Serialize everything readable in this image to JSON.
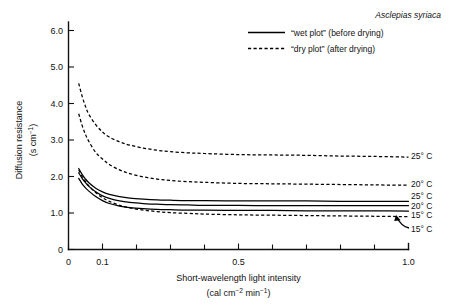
{
  "chart_data": {
    "type": "line",
    "title": "",
    "species_annotation": "Asclepias syriaca",
    "xlabel_line1": "Short-wavelength light intensity",
    "xlabel_line2_prefix": "(cal cm",
    "xlabel_line2_sup1": "−2",
    "xlabel_line2_mid": " min",
    "xlabel_line2_sup2": "−1",
    "xlabel_line2_suffix": ")",
    "ylabel_line1": "Diffusion resistance",
    "ylabel_line2_prefix": "(s cm",
    "ylabel_line2_sup": "−1",
    "ylabel_line2_suffix": ")",
    "xlim": [
      0,
      1.0
    ],
    "ylim": [
      0,
      6.5
    ],
    "grid": false,
    "x_major_ticks": [
      0,
      0.1,
      0.5,
      1.0
    ],
    "x_major_tick_labels": [
      "0",
      "0.1",
      "0.5",
      "1.0"
    ],
    "x_minor_ticks": [
      0.2,
      0.3,
      0.4,
      0.6,
      0.7,
      0.8,
      0.9
    ],
    "y_ticks": [
      0,
      1.0,
      2.0,
      3.0,
      4.0,
      5.0,
      6.0
    ],
    "y_tick_labels": [
      "0",
      "1.0",
      "2.0",
      "3.0",
      "4.0",
      "5.0",
      "6.0"
    ],
    "legend_position": "top-right",
    "legend": [
      {
        "style": "solid",
        "label": "“wet plot” (before drying)"
      },
      {
        "style": "dashed",
        "label": "“dry plot” (after drying)"
      }
    ],
    "series": [
      {
        "name": "dry plot 25° C",
        "plot": "dry plot",
        "style": "dashed",
        "end_label": "25° C",
        "x": [
          0.03,
          0.04,
          0.05,
          0.06,
          0.08,
          0.1,
          0.12,
          0.15,
          0.18,
          0.22,
          0.26,
          0.3,
          0.35,
          0.4,
          0.5,
          0.6,
          0.7,
          0.8,
          0.9,
          1.0
        ],
        "y": [
          4.55,
          4.2,
          3.92,
          3.7,
          3.42,
          3.22,
          3.08,
          2.95,
          2.86,
          2.78,
          2.72,
          2.68,
          2.65,
          2.63,
          2.6,
          2.59,
          2.58,
          2.56,
          2.55,
          2.53
        ]
      },
      {
        "name": "dry plot 20° C",
        "plot": "dry plot",
        "style": "dashed",
        "end_label": "20° C",
        "x": [
          0.03,
          0.04,
          0.05,
          0.06,
          0.08,
          0.1,
          0.12,
          0.15,
          0.18,
          0.22,
          0.26,
          0.3,
          0.35,
          0.4,
          0.5,
          0.6,
          0.7,
          0.8,
          0.9,
          1.0
        ],
        "y": [
          3.72,
          3.4,
          3.15,
          2.96,
          2.66,
          2.48,
          2.33,
          2.18,
          2.08,
          1.99,
          1.93,
          1.89,
          1.86,
          1.84,
          1.81,
          1.8,
          1.79,
          1.78,
          1.77,
          1.76
        ]
      },
      {
        "name": "wet plot 25° C",
        "plot": "wet plot",
        "style": "solid",
        "end_label": "25° C",
        "x": [
          0.03,
          0.04,
          0.05,
          0.06,
          0.08,
          0.1,
          0.12,
          0.15,
          0.18,
          0.22,
          0.26,
          0.3,
          0.35,
          0.4,
          0.5,
          0.6,
          0.7,
          0.8,
          0.9,
          1.0
        ],
        "y": [
          2.22,
          2.06,
          1.93,
          1.83,
          1.68,
          1.58,
          1.51,
          1.45,
          1.41,
          1.38,
          1.36,
          1.35,
          1.34,
          1.34,
          1.33,
          1.33,
          1.33,
          1.32,
          1.32,
          1.32
        ]
      },
      {
        "name": "wet plot 20° C",
        "plot": "wet plot",
        "style": "solid",
        "end_label": "20° C",
        "x": [
          0.03,
          0.04,
          0.05,
          0.06,
          0.08,
          0.1,
          0.12,
          0.15,
          0.18,
          0.22,
          0.26,
          0.3,
          0.35,
          0.4,
          0.5,
          0.6,
          0.7,
          0.8,
          0.9,
          1.0
        ],
        "y": [
          2.1,
          1.95,
          1.83,
          1.73,
          1.58,
          1.47,
          1.4,
          1.33,
          1.29,
          1.26,
          1.24,
          1.23,
          1.22,
          1.21,
          1.21,
          1.2,
          1.2,
          1.2,
          1.2,
          1.2
        ]
      },
      {
        "name": "wet plot 15° C",
        "plot": "wet plot",
        "style": "solid",
        "end_label": "15° C",
        "x": [
          0.03,
          0.04,
          0.05,
          0.06,
          0.08,
          0.1,
          0.12,
          0.15,
          0.18,
          0.22,
          0.26,
          0.3,
          0.35,
          0.4,
          0.5,
          0.6,
          0.7,
          0.8,
          0.9,
          1.0
        ],
        "y": [
          1.95,
          1.8,
          1.69,
          1.6,
          1.45,
          1.34,
          1.26,
          1.19,
          1.15,
          1.12,
          1.1,
          1.09,
          1.08,
          1.08,
          1.07,
          1.07,
          1.06,
          1.06,
          1.06,
          1.05
        ]
      },
      {
        "name": "dry plot 15° C",
        "plot": "dry plot",
        "style": "dashed",
        "end_label": "15° C",
        "x": [
          0.03,
          0.04,
          0.05,
          0.06,
          0.08,
          0.1,
          0.12,
          0.15,
          0.18,
          0.22,
          0.26,
          0.3,
          0.35,
          0.4,
          0.5,
          0.6,
          0.7,
          0.8,
          0.9,
          1.0
        ],
        "y": [
          2.18,
          2.0,
          1.86,
          1.74,
          1.56,
          1.42,
          1.32,
          1.21,
          1.14,
          1.08,
          1.04,
          1.01,
          0.99,
          0.97,
          0.95,
          0.94,
          0.93,
          0.92,
          0.91,
          0.9
        ]
      }
    ]
  }
}
